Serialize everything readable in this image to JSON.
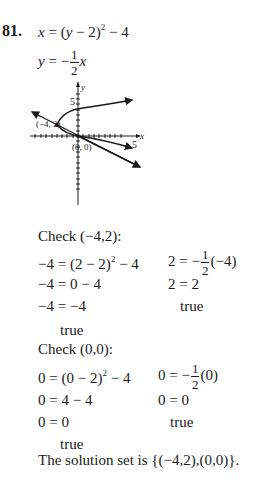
{
  "problem": {
    "number": "81.",
    "equations": {
      "eq1": "x = (y − 2)² − 4",
      "eq1_parts": {
        "lhs": "x",
        "mid": "= (",
        "var": "y",
        "rest": " − 2)",
        "exp": "2",
        "tail": " − 4"
      },
      "eq2_parts": {
        "lhs": "y",
        "eq": "= −",
        "num": "1",
        "den": "2",
        "var": "x"
      }
    }
  },
  "graph": {
    "y_axis_label": "y",
    "x_axis_label": "x",
    "y_tick_label": "5",
    "x_tick_label": "5",
    "point1_label": "(−4, 2)",
    "point2_label": "(0, 0)"
  },
  "check1": {
    "heading": "Check",
    "point": "(−4,2):",
    "left": [
      "−4 = (2 − 2)",
      "−4 = 0 − 4",
      "−4 = −4"
    ],
    "left_exp": "2",
    "left_tail": " − 4",
    "left_result": "true",
    "right_prefix": "2 = −",
    "right_num": "1",
    "right_den": "2",
    "right_suffix": "(−4)",
    "right": [
      "2 = 2"
    ],
    "right_result": "true"
  },
  "check2": {
    "heading": "Check",
    "point": "(0,0):",
    "left": [
      "0 = (0 − 2)",
      "0 = 4 − 4",
      "0 = 0"
    ],
    "left_exp": "2",
    "left_tail": " − 4",
    "left_result": "true",
    "right_prefix": "0 = −",
    "right_num": "1",
    "right_den": "2",
    "right_suffix": "(0)",
    "right": [
      "0 = 0"
    ],
    "right_result": "true"
  },
  "conclusion": {
    "text": "The solution set is",
    "set": "{(−4,2),(0,0)}."
  }
}
